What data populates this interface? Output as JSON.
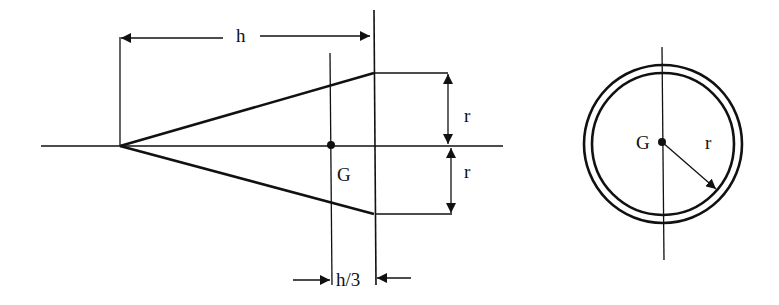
{
  "figure": {
    "side_view": {
      "labels": {
        "height": "h",
        "radius_top": "r",
        "radius_bottom": "r",
        "centroid": "G",
        "centroid_offset": "h/3"
      }
    },
    "end_view": {
      "labels": {
        "centroid": "G",
        "radius": "r"
      }
    }
  },
  "colors": {
    "stroke": "#111111",
    "background": "#ffffff"
  }
}
